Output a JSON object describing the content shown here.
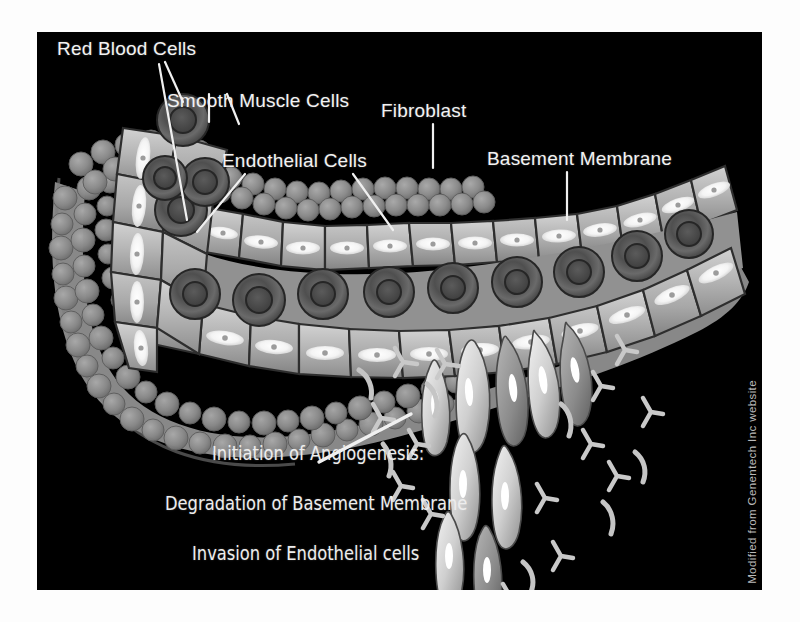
{
  "figure": {
    "kind": "biomedical-illustration",
    "panel_background": "#000000",
    "page_background": "#ffffff",
    "text_color": "#f2f2f2"
  },
  "labels": {
    "red_blood_cells": "Red Blood Cells",
    "smooth_muscle_cells": "Smooth Muscle Cells",
    "endothelial_cells": "Endothelial Cells",
    "fibroblast": "Fibroblast",
    "basement_membrane": "Basement Membrane"
  },
  "caption": {
    "line1": "Initiation of Angiogenesis:",
    "line2": "Degradation of Basement Membrane",
    "line3": "Invasion of Endothelial cells"
  },
  "attribution": {
    "text": "Modified from Genentech Inc website"
  },
  "legend_structures": [
    {
      "name": "red-blood-cell",
      "description": "dark ring-shaped erythrocyte in vessel lumen",
      "fill": "#4a4a4a"
    },
    {
      "name": "endothelial-cell",
      "description": "light polygonal cell with bright lens-shaped nucleus",
      "fill": "#b4b4b4"
    },
    {
      "name": "smooth-muscle-cell",
      "description": "cobblestone layer of small round cells on outer wall",
      "fill": "#8c8c8c"
    },
    {
      "name": "basement-membrane",
      "description": "bumpy grey sheath surrounding the vessel",
      "fill": "#9a9a9a"
    },
    {
      "name": "fibroblast",
      "description": "cell embedded in the outer cobblestone layer",
      "fill": "#7d7d7d"
    },
    {
      "name": "migrating-endothelial-cell",
      "description": "elongated spindle cell sprouting downward",
      "fill": "#dcdcdc"
    },
    {
      "name": "membrane-fragment",
      "description": "Y-shaped degraded basement-membrane debris",
      "fill": "#c9c9c9"
    }
  ]
}
